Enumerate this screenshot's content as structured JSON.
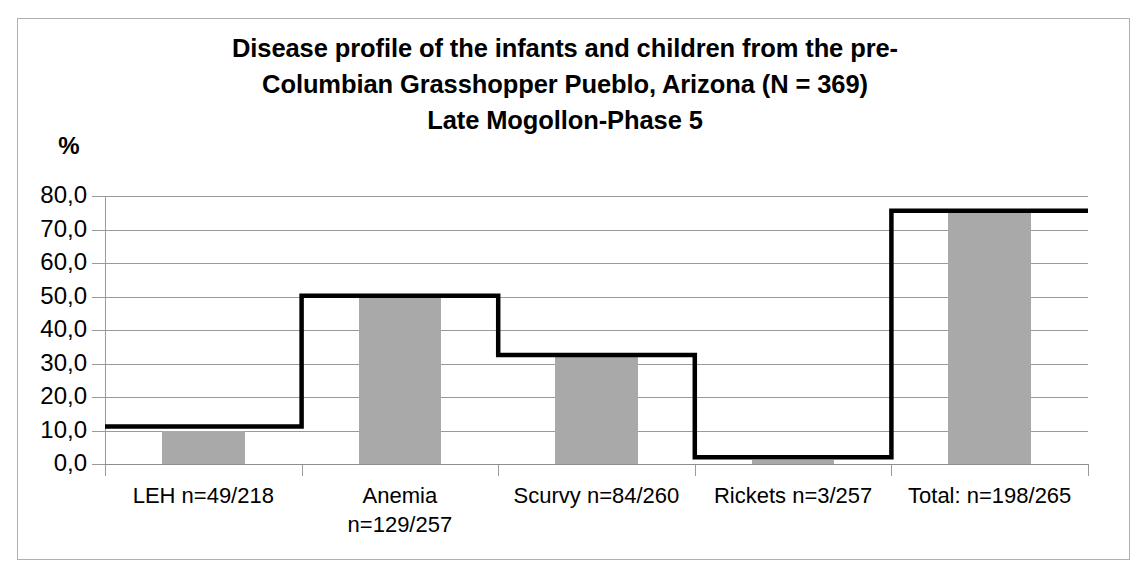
{
  "chart_data": {
    "type": "bar",
    "title_lines": [
      "Disease profile of the infants and children from the pre-",
      "Columbian Grasshopper Pueblo, Arizona (N = 369)",
      "Late Mogollon-Phase 5"
    ],
    "xlabel": "",
    "ylabel": "%",
    "ylim": [
      0,
      80
    ],
    "ytick_labels": [
      "80,0",
      "70,0",
      "60,0",
      "50,0",
      "40,0",
      "30,0",
      "20,0",
      "10,0",
      "0,0"
    ],
    "ytick_values": [
      80,
      70,
      60,
      50,
      40,
      30,
      20,
      10,
      0
    ],
    "grid": true,
    "legend": "none",
    "categories": [
      "LEH n=49/218",
      "Anemia n=129/257",
      "Scurvy n=84/260",
      "Rickets n=3/257",
      "Total: n=198/265"
    ],
    "category_label_lines": [
      [
        "LEH n=49/218"
      ],
      [
        "Anemia",
        "n=129/257"
      ],
      [
        "Scurvy n=84/260"
      ],
      [
        "Rickets n=3/257"
      ],
      [
        "Total: n=198/265"
      ]
    ],
    "series": [
      {
        "name": "bars",
        "type": "bar",
        "values": [
          10.0,
          50.0,
          32.3,
          1.2,
          75.5
        ]
      },
      {
        "name": "step-line",
        "type": "step",
        "values": [
          11.2,
          50.2,
          32.5,
          2.0,
          75.6
        ]
      }
    ],
    "colors": {
      "bar_fill": "#a9a9a9",
      "line": "#000000",
      "gridline": "#9a9a9a",
      "frame": "#b0b0b0",
      "text": "#000000"
    }
  }
}
